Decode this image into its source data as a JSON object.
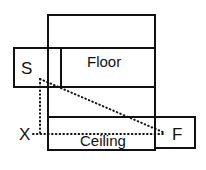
{
  "diagram": {
    "type": "geometric-optics-diagram",
    "stroke_color": "#111111",
    "background_color": "#ffffff",
    "regions": [
      {
        "id": "floor",
        "label": "Floor"
      },
      {
        "id": "ceiling",
        "label": "Ceiling"
      }
    ],
    "points": [
      {
        "id": "source",
        "label": "S"
      },
      {
        "id": "image-x",
        "label": "X"
      },
      {
        "id": "focus",
        "label": "F"
      }
    ],
    "rays": [
      {
        "id": "vertical-dotted",
        "style": "dotted"
      },
      {
        "id": "diagonal-dotted",
        "style": "dotted"
      },
      {
        "id": "horizontal-dotted",
        "style": "dotted"
      }
    ]
  }
}
